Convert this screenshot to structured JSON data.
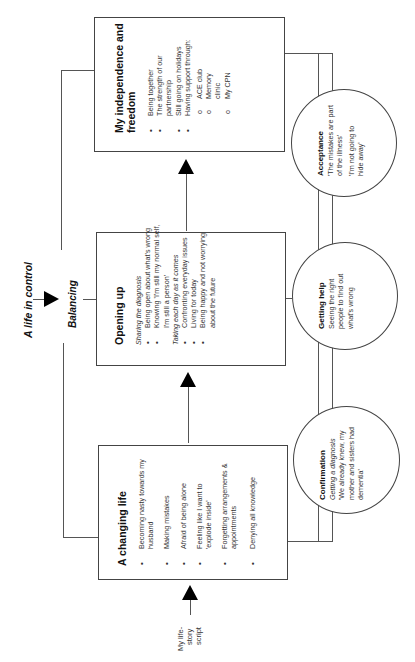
{
  "diagram": {
    "orientation": "rotated -90deg (reads bottom-to-top)",
    "top_label": "A life in control",
    "balancing_label": "Balancing",
    "start_label": [
      "My life-",
      "story",
      "script"
    ],
    "boxes": [
      {
        "id": "a-changing-life",
        "title": "A changing life",
        "items": [
          "Becoming nasty towards my husband",
          "Making mistakes",
          "Afraid of being alone",
          "Feeling like I want to 'explode inside'",
          "Forgetting arrangements & appointments",
          "Denying all knowledge"
        ]
      },
      {
        "id": "opening-up",
        "title": "Opening up",
        "groups": [
          {
            "heading": "Sharing the diagnosis",
            "items": [
              "Being open about what's wrong",
              "Knowing 'I'm still my normal self, I'm still a person'"
            ]
          },
          {
            "heading": "Taking each day as it comes",
            "items": [
              "Confronting everyday issues",
              "Living for today",
              "Being happy and not worrying about the future"
            ]
          }
        ]
      },
      {
        "id": "my-independence-and-freedom",
        "title": "My independence and freedom",
        "items": [
          "Being together",
          "The strength of our partnership",
          "Still going on holidays",
          "Having support through:"
        ],
        "sub_items": [
          "ACE club",
          "Memory clinic",
          "My CPN"
        ]
      }
    ],
    "circles": [
      {
        "id": "confirmation",
        "title": "Confirmation",
        "subtitle": "Getting a diagnosis",
        "text": "'We already knew, my mother and sisters had dementia'"
      },
      {
        "id": "getting-help",
        "title": "Getting help",
        "text": "Seeing the right people to find out what's wrong"
      },
      {
        "id": "acceptance",
        "title": "Acceptance",
        "quotes": [
          "'The mistakes are part of the illness'",
          "'I'm not going to hide away'"
        ]
      }
    ]
  }
}
